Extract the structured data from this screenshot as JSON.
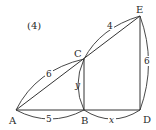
{
  "figure": {
    "problem_label": "(4)",
    "points": {
      "A": "A",
      "B": "B",
      "C": "C",
      "D": "D",
      "E": "E"
    },
    "measures": {
      "AC": "6",
      "CE": "4",
      "ED": "6",
      "AB": "5",
      "BD": "x",
      "CB": "y"
    },
    "colors": {
      "stroke": "#333333",
      "text": "#2a2a2a",
      "background": "#ffffff"
    }
  }
}
